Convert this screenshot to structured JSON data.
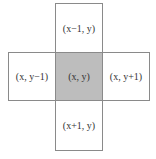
{
  "diagram": {
    "type": "4-neighborhood grid",
    "colors": {
      "center_fill": "#bdbdbd",
      "cell_fill": "#ffffff",
      "border": "#8a8a8a",
      "text": "#333333"
    },
    "cells": {
      "top": {
        "label": "(x−1, y)"
      },
      "left": {
        "label": "(x, y−1)"
      },
      "center": {
        "label": "(x, y)"
      },
      "right": {
        "label": "(x, y+1)"
      },
      "bottom": {
        "label": "(x+1, y)"
      }
    }
  }
}
